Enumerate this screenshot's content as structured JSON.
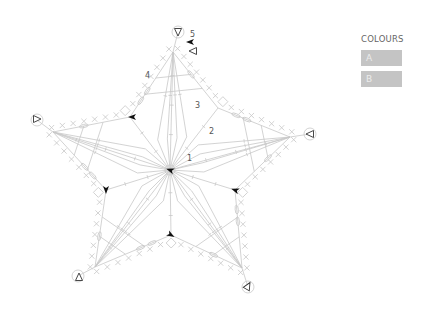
{
  "diagram": {
    "type": "crochet-chart",
    "center": [
      170,
      170
    ],
    "tips": [
      {
        "name": "top",
        "tip": [
          173,
          52
        ],
        "loop": [
          178,
          32
        ]
      },
      {
        "name": "right",
        "tip": [
          290,
          137
        ],
        "loop": [
          310,
          134
        ]
      },
      {
        "name": "bottom-right",
        "tip": [
          242,
          268
        ],
        "loop": [
          248,
          287
        ]
      },
      {
        "name": "bottom-left",
        "tip": [
          95,
          267
        ],
        "loop": [
          78,
          276
        ]
      },
      {
        "name": "left",
        "tip": [
          53,
          132
        ],
        "loop": [
          37,
          120
        ]
      }
    ],
    "valleys": [
      [
        218,
        108
      ],
      [
        235,
        190
      ],
      [
        171,
        235
      ],
      [
        106,
        190
      ],
      [
        130,
        117
      ]
    ],
    "round_labels": [
      {
        "text": "1",
        "x": 187,
        "y": 161
      },
      {
        "text": "2",
        "x": 209,
        "y": 134
      },
      {
        "text": "3",
        "x": 195,
        "y": 108
      },
      {
        "text": "4",
        "x": 145,
        "y": 78
      },
      {
        "text": "5",
        "x": 190,
        "y": 37
      }
    ],
    "join_arrows_filled": [
      {
        "x": 170,
        "y": 170,
        "rot": 200
      },
      {
        "x": 132,
        "y": 117,
        "rot": 180
      },
      {
        "x": 106,
        "y": 190,
        "rot": 90
      },
      {
        "x": 235,
        "y": 190,
        "rot": 200
      },
      {
        "x": 171,
        "y": 235,
        "rot": 30
      },
      {
        "x": 190,
        "y": 42,
        "rot": 180
      }
    ],
    "fasten_off_triangles": [
      {
        "x": 178,
        "y": 32,
        "rot": 90
      },
      {
        "x": 193,
        "y": 51,
        "rot": 180
      },
      {
        "x": 37,
        "y": 119,
        "rot": 0
      },
      {
        "x": 310,
        "y": 134,
        "rot": 180
      },
      {
        "x": 79,
        "y": 277,
        "rot": -90
      },
      {
        "x": 248,
        "y": 286,
        "rot": -60
      }
    ],
    "line_color": "#c8c8c8",
    "marker_color": "#111111"
  },
  "legend": {
    "title": "COLOURS",
    "items": [
      {
        "label": "A",
        "color": "#c4c4c4"
      },
      {
        "label": "B",
        "color": "#c4c4c4"
      }
    ]
  }
}
